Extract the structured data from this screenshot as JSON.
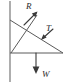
{
  "figure": {
    "type": "force-diagram",
    "background_color": "#ffffff",
    "line_color": "#5a5a5a",
    "vector_color": "#3a3a3a",
    "width": 69,
    "height": 83
  },
  "structure": {
    "wall": {
      "name": "wall",
      "x": 10,
      "y_top": 1,
      "y_bottom": 82
    },
    "beam": {
      "name": "horizontal-beam",
      "x_start": 10,
      "x_end": 63,
      "y": 53
    },
    "strut": {
      "name": "diagonal-strut",
      "x_start": 10,
      "y_start": 20,
      "x_end": 63,
      "y_end": 53
    },
    "brace": {
      "name": "diagonal-brace",
      "x_start": 11,
      "y_start": 53,
      "x_end": 37,
      "y_end": 15
    }
  },
  "vectors": [
    {
      "id": "R",
      "label": "R",
      "description": "reaction-force",
      "direction": "up-right",
      "tail_x": 24,
      "tail_y": 25,
      "tip_x": 37,
      "tip_y": 12,
      "label_x": 26,
      "label_y": 9
    },
    {
      "id": "T",
      "label": "T",
      "description": "tension-force",
      "direction": "down-left",
      "tail_x": 53,
      "tail_y": 29,
      "tip_x": 41,
      "tip_y": 40,
      "label_x": 46,
      "label_y": 31
    },
    {
      "id": "W",
      "label": "W",
      "description": "weight-force",
      "direction": "down",
      "tail_x": 36,
      "tail_y": 53,
      "tip_x": 36,
      "tip_y": 73,
      "label_x": 42,
      "label_y": 77
    }
  ]
}
